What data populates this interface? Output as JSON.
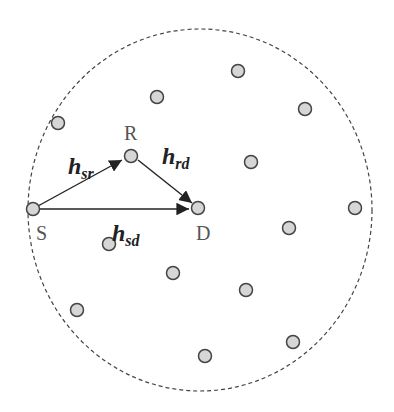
{
  "diagram": {
    "boundary": {
      "cx": 200,
      "cy": 210,
      "rx": 172,
      "ry": 181,
      "style": "dashed"
    },
    "node_color": "#d6d6d6",
    "node_stroke": "#444444",
    "labels": {
      "source": "S",
      "relay": "R",
      "destination": "D"
    },
    "channels": [
      {
        "main": "h",
        "sub": "sr",
        "from": "S",
        "to": "R"
      },
      {
        "main": "h",
        "sub": "rd",
        "from": "R",
        "to": "D"
      },
      {
        "main": "h",
        "sub": "sd",
        "from": "S",
        "to": "D"
      }
    ],
    "key_nodes": {
      "S": [
        33,
        209
      ],
      "R": [
        131,
        156
      ],
      "D": [
        198,
        208
      ]
    },
    "other_nodes": [
      [
        238,
        71
      ],
      [
        157,
        97
      ],
      [
        305,
        109
      ],
      [
        58,
        123
      ],
      [
        251,
        162
      ],
      [
        289,
        228
      ],
      [
        355,
        208
      ],
      [
        109,
        244
      ],
      [
        173,
        273
      ],
      [
        246,
        290
      ],
      [
        77,
        310
      ],
      [
        293,
        342
      ],
      [
        205,
        356
      ]
    ]
  }
}
